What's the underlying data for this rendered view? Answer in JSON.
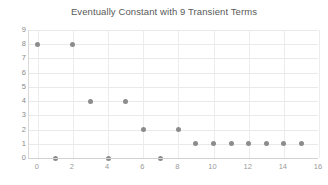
{
  "chart_data": {
    "type": "scatter",
    "title": "Eventually Constant with 9 Transient Terms",
    "xlabel": "",
    "ylabel": "",
    "x": [
      0,
      1,
      2,
      3,
      4,
      5,
      6,
      7,
      8,
      9,
      10,
      11,
      12,
      13,
      14,
      15
    ],
    "values": [
      8,
      0,
      8,
      4,
      0,
      4,
      2,
      0,
      2,
      1,
      1,
      1,
      1,
      1,
      1,
      1
    ],
    "points": [
      {
        "x": 0,
        "y": 8
      },
      {
        "x": 1,
        "y": 0
      },
      {
        "x": 2,
        "y": 8
      },
      {
        "x": 3,
        "y": 4
      },
      {
        "x": 4,
        "y": 0
      },
      {
        "x": 5,
        "y": 4
      },
      {
        "x": 6,
        "y": 2
      },
      {
        "x": 7,
        "y": 0
      },
      {
        "x": 8,
        "y": 2
      },
      {
        "x": 9,
        "y": 1
      },
      {
        "x": 10,
        "y": 1
      },
      {
        "x": 11,
        "y": 1
      },
      {
        "x": 12,
        "y": 1
      },
      {
        "x": 13,
        "y": 1
      },
      {
        "x": 14,
        "y": 1
      },
      {
        "x": 15,
        "y": 1
      }
    ],
    "xlim": [
      -0.5,
      16
    ],
    "ylim": [
      0,
      9
    ],
    "xticks": [
      0,
      2,
      4,
      6,
      8,
      10,
      12,
      14,
      16
    ],
    "yticks": [
      0,
      1,
      2,
      3,
      4,
      5,
      6,
      7,
      8,
      9
    ],
    "xtick_labels": [
      "0",
      "2",
      "4",
      "6",
      "8",
      "10",
      "12",
      "14",
      "16"
    ],
    "ytick_labels": [
      "0",
      "1",
      "2",
      "3",
      "4",
      "5",
      "6",
      "7",
      "8",
      "9"
    ],
    "grid": true,
    "legend": null,
    "marker_color": "#8c8c8c",
    "grid_color": "#e9e9e9",
    "axis_color": "#d2d2d2",
    "background_color": "#ffffff",
    "title_color": "#595959",
    "transient_count": 9,
    "constant_value": 1
  }
}
